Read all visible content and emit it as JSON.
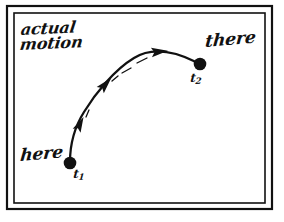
{
  "figure": {
    "background_color": "#ffffff",
    "ink_color": "#111111",
    "caption_note": "hand-drawn physics diagram of actual motion along a curved path",
    "frame": {
      "name": "double-rule-border",
      "outer": {
        "x": 7,
        "y": 6,
        "width": 265,
        "height": 203,
        "stroke_width": 2.2
      },
      "inner": {
        "x": 14,
        "y": 13,
        "width": 251,
        "height": 190,
        "stroke_width": 1.6
      },
      "stroke_color": "#111111"
    },
    "labels": {
      "actual_motion_line1": "actual",
      "actual_motion_line2": "motion",
      "here": "here",
      "there": "there",
      "t1_base": "t",
      "t1_sub": "1",
      "t2_base": "t",
      "t2_sub": "2"
    },
    "points": [
      {
        "name": "start-point",
        "label": "here",
        "time_label": "t1",
        "x": 70,
        "y": 163,
        "radius": 6.2
      },
      {
        "name": "end-point",
        "label": "there",
        "time_label": "t2",
        "x": 200,
        "y": 64,
        "radius": 6.2
      }
    ],
    "path": {
      "name": "actual-motion-curve",
      "d": "M 70 162 C 70 146 74 128 84 112 C 95 94 114 70 134 58 C 150 48 172 50 196 62",
      "stroke_width": 2.3,
      "stroke_color": "#111111",
      "direction": "from here (t1) to there (t2)"
    },
    "arrowheads": [
      {
        "name": "arrowhead-1",
        "x": 79,
        "y": 126,
        "angle_deg": -63,
        "size": 9.5
      },
      {
        "name": "arrowhead-2",
        "x": 104,
        "y": 86,
        "angle_deg": -48,
        "size": 10.5
      },
      {
        "name": "arrowhead-3",
        "x": 157,
        "y": 52,
        "angle_deg": -6,
        "size": 10.5
      }
    ],
    "tick_marks": [
      {
        "name": "tick-1",
        "x1": 86,
        "y1": 116,
        "x2": 89,
        "y2": 110
      },
      {
        "name": "tick-2",
        "x1": 113,
        "y1": 80,
        "x2": 118,
        "y2": 76
      },
      {
        "name": "tick-3",
        "x1": 122,
        "y1": 72,
        "x2": 130,
        "y2": 68
      },
      {
        "name": "tick-4",
        "x1": 136,
        "y1": 62,
        "x2": 146,
        "y2": 58
      }
    ]
  }
}
